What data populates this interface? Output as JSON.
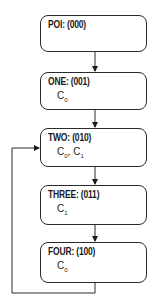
{
  "diagram": {
    "states": [
      {
        "id": "poi",
        "title": "POI: (000)",
        "vars": []
      },
      {
        "id": "one",
        "title": "ONE: (001)",
        "vars": [
          "C0"
        ]
      },
      {
        "id": "two",
        "title": "TWO: (010)",
        "vars": [
          "C0",
          "C1"
        ]
      },
      {
        "id": "three",
        "title": "THREE: (011)",
        "vars": [
          "C1"
        ]
      },
      {
        "id": "four",
        "title": "FOUR: (100)",
        "vars": [
          "C0"
        ]
      }
    ],
    "transitions": [
      {
        "from": "poi",
        "to": "one"
      },
      {
        "from": "one",
        "to": "two"
      },
      {
        "from": "two",
        "to": "three"
      },
      {
        "from": "three",
        "to": "four"
      },
      {
        "from": "four",
        "to": "two",
        "type": "loop-back"
      }
    ],
    "labels": {
      "one_var": {
        "base": "C",
        "sub": "0"
      },
      "two_var_a": {
        "base": "C",
        "sub": "0"
      },
      "two_sep": ", ",
      "two_var_b": {
        "base": "C",
        "sub": "1"
      },
      "three_var": {
        "base": "C",
        "sub": "1"
      },
      "four_var": {
        "base": "C",
        "sub": "0"
      }
    },
    "colors": {
      "stroke": "#2a2a2a",
      "text": "#1a1a1a",
      "background": "#ffffff"
    }
  }
}
